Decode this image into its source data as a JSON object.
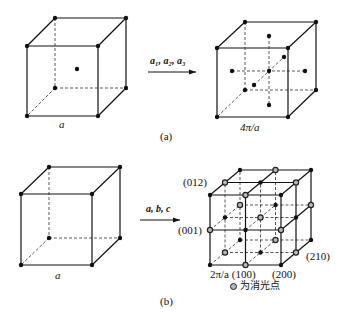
{
  "panel_a": {
    "caption": "(a)",
    "left_cube": {
      "edge_label": "a",
      "front": [
        [
          27,
          46
        ],
        [
          98,
          46
        ],
        [
          98,
          116
        ],
        [
          27,
          116
        ]
      ],
      "back": [
        [
          55,
          18
        ],
        [
          126,
          18
        ],
        [
          126,
          88
        ],
        [
          55,
          88
        ]
      ],
      "dots": [
        [
          27,
          46
        ],
        [
          98,
          46
        ],
        [
          98,
          116
        ],
        [
          27,
          116
        ],
        [
          55,
          18
        ],
        [
          126,
          18
        ],
        [
          126,
          88
        ],
        [
          55,
          88
        ],
        [
          77,
          69
        ]
      ]
    },
    "arrow": {
      "label": "a₁, a₂, a₃",
      "x1": 148,
      "x2": 196,
      "y": 72
    },
    "right_cube": {
      "edge_label": "4π/a",
      "front": [
        [
          217,
          48
        ],
        [
          288,
          48
        ],
        [
          288,
          117
        ],
        [
          217,
          117
        ]
      ],
      "back": [
        [
          245,
          22
        ],
        [
          316,
          22
        ],
        [
          316,
          90
        ],
        [
          245,
          90
        ]
      ],
      "axes": [
        [
          [
            232,
            71
          ],
          [
            305,
            71
          ]
        ],
        [
          [
            269,
            36
          ],
          [
            269,
            105
          ]
        ],
        [
          [
            254,
            85
          ],
          [
            284,
            57
          ]
        ]
      ],
      "axes_extra": [
        [
          [
            217,
            117
          ],
          [
            245,
            90
          ]
        ]
      ],
      "dots": [
        [
          217,
          48
        ],
        [
          288,
          48
        ],
        [
          288,
          117
        ],
        [
          217,
          117
        ],
        [
          245,
          22
        ],
        [
          316,
          22
        ],
        [
          316,
          90
        ],
        [
          245,
          90
        ],
        [
          269,
          71
        ],
        [
          269,
          36
        ],
        [
          269,
          105
        ],
        [
          232,
          71
        ],
        [
          305,
          71
        ],
        [
          254,
          85
        ],
        [
          284,
          57
        ]
      ]
    }
  },
  "panel_b": {
    "caption": "(b)",
    "left_cube": {
      "edge_label": "a",
      "front": [
        [
          21,
          194
        ],
        [
          92,
          194
        ],
        [
          92,
          265
        ],
        [
          21,
          265
        ]
      ],
      "back": [
        [
          49,
          167
        ],
        [
          120,
          167
        ],
        [
          120,
          238
        ],
        [
          49,
          238
        ]
      ],
      "dots": [
        [
          21,
          194
        ],
        [
          92,
          194
        ],
        [
          92,
          265
        ],
        [
          21,
          265
        ],
        [
          49,
          167
        ],
        [
          120,
          167
        ],
        [
          120,
          238
        ],
        [
          49,
          238
        ]
      ]
    },
    "arrow": {
      "label": "a, b, c",
      "x1": 140,
      "x2": 180,
      "y": 220
    },
    "right_cube": {
      "origin": [
        210,
        265
      ],
      "step_x": 35.5,
      "step_y": 35,
      "depth_dx": 15,
      "depth_dy": -12.5,
      "labels": {
        "p012": "(012)",
        "p001": "(001)",
        "p100": "2π/a (100)",
        "p200": "(200)",
        "p210": "(210)"
      },
      "legend": "为消光点",
      "extinct_color": "#b8b8b8",
      "point_color": "#111111"
    }
  }
}
